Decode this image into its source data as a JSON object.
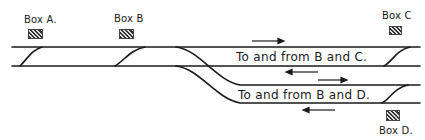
{
  "diagram": {
    "type": "railway-junction-signal-boxes",
    "signal_boxes": [
      {
        "id": "A",
        "label": "Box A."
      },
      {
        "id": "B",
        "label": "Box B"
      },
      {
        "id": "C",
        "label": "Box C"
      },
      {
        "id": "D",
        "label": "Box D."
      }
    ],
    "track_labels": {
      "upper_pair": "To and from B and C.",
      "lower_pair": "To and from B and D."
    },
    "arrows": [
      {
        "track": "upper-up",
        "direction": "right"
      },
      {
        "track": "upper-down",
        "direction": "left"
      },
      {
        "track": "lower-up",
        "direction": "right"
      },
      {
        "track": "lower-down",
        "direction": "left"
      }
    ],
    "colors": {
      "line": "#1a1a1a",
      "background": "#ffffff"
    }
  }
}
